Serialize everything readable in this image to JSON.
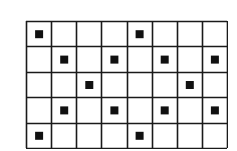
{
  "grid": {
    "columns": 8,
    "rows": 5,
    "line_color": "#1a1a1a",
    "dot_color": "#111111",
    "background": "#ffffff",
    "dots": [
      {
        "row": 0,
        "col": 0
      },
      {
        "row": 0,
        "col": 4
      },
      {
        "row": 1,
        "col": 1
      },
      {
        "row": 1,
        "col": 3
      },
      {
        "row": 1,
        "col": 5
      },
      {
        "row": 1,
        "col": 7
      },
      {
        "row": 2,
        "col": 2
      },
      {
        "row": 2,
        "col": 6
      },
      {
        "row": 3,
        "col": 1
      },
      {
        "row": 3,
        "col": 3
      },
      {
        "row": 3,
        "col": 5
      },
      {
        "row": 3,
        "col": 7
      },
      {
        "row": 4,
        "col": 0
      },
      {
        "row": 4,
        "col": 4
      }
    ]
  }
}
